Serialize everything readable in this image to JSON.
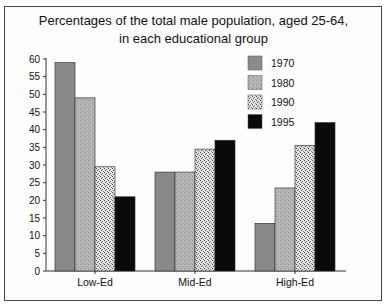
{
  "chart_data": {
    "type": "bar",
    "title": "Percentages of the total male population, aged 25-64, in each educational group",
    "title_lines": [
      "Percentages of the total male population, aged 25-64,",
      "in each educational group"
    ],
    "xlabel": "",
    "ylabel": "",
    "categories": [
      "Low-Ed",
      "Mid-Ed",
      "High-Ed"
    ],
    "series": [
      {
        "name": "1970",
        "values": [
          59,
          28,
          13.5
        ],
        "color": "#8a8a8a",
        "pattern": "solid"
      },
      {
        "name": "1980",
        "values": [
          49,
          28,
          23.5
        ],
        "color": "#ababab",
        "pattern": "fine-speckle"
      },
      {
        "name": "1990",
        "values": [
          29.5,
          34.5,
          35.5
        ],
        "color": "#d8d8d8",
        "pattern": "dense-speckle"
      },
      {
        "name": "1995",
        "values": [
          21,
          37,
          42
        ],
        "color": "#0a0a0a",
        "pattern": "solid"
      }
    ],
    "ylim": [
      0,
      60
    ],
    "yticks": [
      0,
      5,
      10,
      15,
      20,
      25,
      30,
      35,
      40,
      45,
      50,
      55,
      60
    ],
    "grid": false,
    "legend_position": "top-right-inside"
  }
}
